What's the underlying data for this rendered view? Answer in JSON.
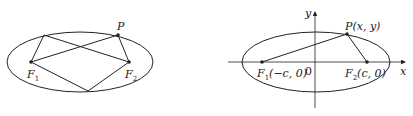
{
  "left_figure": {
    "point_label": "P",
    "focus1_label": "F",
    "focus1_sub": "1",
    "focus2_label": "F",
    "focus2_sub": "2"
  },
  "right_figure": {
    "y_axis_label": "y",
    "x_axis_label": "x",
    "origin_label": "0",
    "point_label": "P(x, y)",
    "focus1_label": "F",
    "focus1_sub": "1",
    "focus1_coords": "(−c, 0)",
    "focus2_label": "F",
    "focus2_sub": "2",
    "focus2_coords": "(c, 0)"
  },
  "colors": {
    "stroke": "#222222",
    "background": "#ffffff"
  }
}
